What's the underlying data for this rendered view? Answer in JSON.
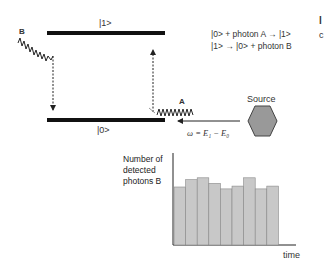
{
  "levels": {
    "excited": {
      "label": "|1>"
    },
    "ground": {
      "label": "|0>"
    }
  },
  "photons": {
    "a_label": "A",
    "b_label": "B"
  },
  "source": {
    "label": "Source",
    "fill": "#999999"
  },
  "frequency_label": "ω = E₁ − E₀",
  "equations": [
    "|0> + photon A → |1>",
    "|1> → |0> + photon B"
  ],
  "cutoff_right": {
    "glyph1": "l",
    "glyph2": "c"
  },
  "chart_data": {
    "type": "bar",
    "title": "",
    "xlabel": "time",
    "ylabel": "Number of detected photons B",
    "ylabel_lines": [
      "Number of",
      "detected",
      "photons B"
    ],
    "categories": [
      "t1",
      "t2",
      "t3",
      "t4",
      "t5",
      "t6",
      "t7",
      "t8",
      "t9"
    ],
    "values": [
      63,
      71,
      73,
      67,
      61,
      64,
      73,
      61,
      64
    ],
    "ylim": [
      0,
      100
    ],
    "grid": false,
    "bar_color": "#c8c8c8"
  },
  "colors": {
    "line": "#111111",
    "bar": "#c8c8c8",
    "bar_edge": "#888888",
    "hexagon": "#999999"
  }
}
